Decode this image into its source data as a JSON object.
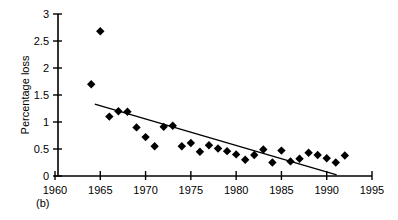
{
  "chart_data": {
    "type": "scatter",
    "title": "",
    "panel_label": "(b)",
    "xlabel": "",
    "ylabel": "Percentage loss",
    "xlim": [
      1960,
      1995
    ],
    "ylim": [
      0,
      3
    ],
    "xticks": [
      1960,
      1965,
      1970,
      1975,
      1980,
      1985,
      1990,
      1995
    ],
    "xtick_labels": [
      "1960",
      "1965",
      "1970",
      "1975",
      "1980",
      "1985",
      "1990",
      "1995"
    ],
    "yticks": [
      0,
      0.5,
      1,
      1.5,
      2,
      2.5,
      3
    ],
    "ytick_labels": [
      "0",
      "0.5",
      "1",
      "1.5",
      "2",
      "2.5",
      "3"
    ],
    "grid": false,
    "legend": null,
    "marker": "diamond",
    "marker_color": "#000000",
    "series": [
      {
        "name": "Percentage loss",
        "x": [
          1964,
          1965,
          1966,
          1967,
          1968,
          1969,
          1970,
          1971,
          1972,
          1973,
          1974,
          1975,
          1976,
          1977,
          1978,
          1979,
          1980,
          1981,
          1982,
          1983,
          1984,
          1985,
          1986,
          1987,
          1988,
          1989,
          1990,
          1991,
          1992
        ],
        "y": [
          1.7,
          2.68,
          1.1,
          1.2,
          1.19,
          0.9,
          0.72,
          0.55,
          0.91,
          0.93,
          0.55,
          0.61,
          0.45,
          0.57,
          0.51,
          0.46,
          0.4,
          0.3,
          0.39,
          0.49,
          0.25,
          0.47,
          0.27,
          0.32,
          0.43,
          0.39,
          0.33,
          0.25,
          0.38
        ]
      }
    ],
    "trend_line": {
      "name": "linear trend",
      "x_start": 1964.4,
      "y_start": 1.33,
      "x_end": 1991.1,
      "y_end": 0.02
    }
  }
}
